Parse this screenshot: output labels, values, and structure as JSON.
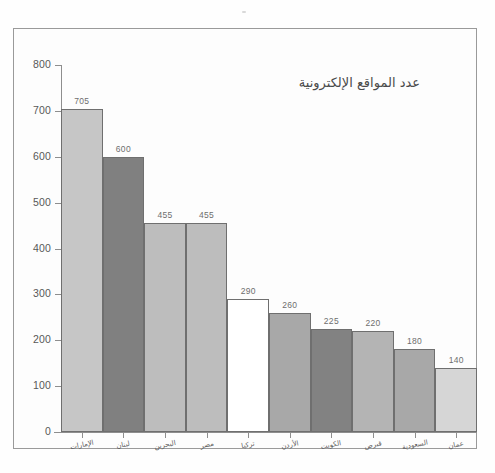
{
  "chart_data": {
    "type": "bar",
    "title": "عدد المواقع الإلكترونية",
    "xlabel": "",
    "ylabel": "",
    "ylim": [
      0,
      800
    ],
    "ytick_step": 100,
    "grid": false,
    "legend": "none",
    "categories": [
      "الإمارات",
      "لبنان",
      "البحرين",
      "مصر",
      "تركيا",
      "الأردن",
      "الكويت",
      "قبرص",
      "السعودية",
      "عمان"
    ],
    "values": [
      705,
      600,
      455,
      455,
      290,
      260,
      225,
      220,
      180,
      140
    ],
    "bar_colors": [
      "#c6c6c6",
      "#808080",
      "#bdbdbd",
      "#bdbdbd",
      "#ffffff",
      "#a8a8a8",
      "#828282",
      "#b4b4b4",
      "#a8a8a8",
      "#d6d6d6"
    ],
    "ytick_labels": [
      "0",
      "100",
      "200",
      "300",
      "400",
      "500",
      "600",
      "700",
      "800"
    ],
    "ytick_values": [
      0,
      100,
      200,
      300,
      400,
      500,
      600,
      700,
      800
    ],
    "data_labels": [
      "705",
      "600",
      "455",
      "455",
      "290",
      "260",
      "225",
      "220",
      "180",
      "140"
    ],
    "axis_color": "#8e8e8e",
    "bar_edge_color": "#6f6f6f",
    "frame_color": "#9a9a9a",
    "text_color": "#585858"
  }
}
